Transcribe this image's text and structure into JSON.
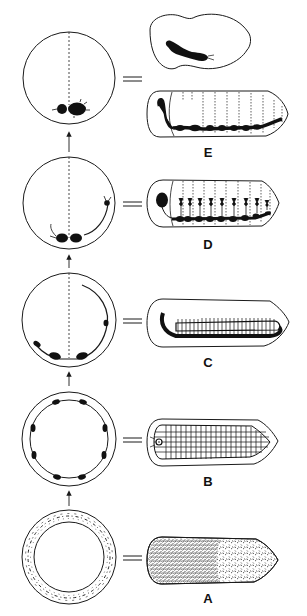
{
  "figure": {
    "stroke_color": "#1a1a1a",
    "fill_color": "#111111",
    "background": "#ffffff",
    "stages": [
      {
        "id": "E",
        "label": "E"
      },
      {
        "id": "D",
        "label": "D"
      },
      {
        "id": "C",
        "label": "C"
      },
      {
        "id": "B",
        "label": "B"
      },
      {
        "id": "A",
        "label": "A"
      }
    ]
  }
}
